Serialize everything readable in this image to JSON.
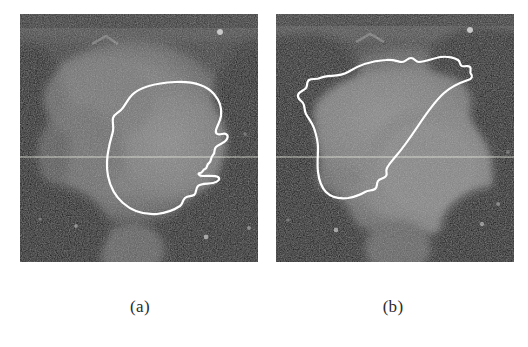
{
  "figure": {
    "type": "medical-image-figure",
    "modality": "cardiac CT cross-section",
    "background_color": "#ffffff",
    "panel_count": 2,
    "panels": [
      {
        "id": "a",
        "caption": "(a)",
        "x": 20,
        "y": 14,
        "width": 238,
        "height": 248,
        "contour_color": "#ffffff",
        "contour_label": "segmented-ventricle-contour",
        "description": "Left panel: grayscale cardiac cross-section with a white closed segmentation contour outlining a roughly circular chamber in the right-center region; the contour has a jagged indentation along its right border.",
        "scanline_y": 157,
        "scanline_color": "#e8e8e0"
      },
      {
        "id": "b",
        "caption": "(b)",
        "x": 276,
        "y": 14,
        "width": 238,
        "height": 248,
        "contour_color": "#ffffff",
        "contour_label": "segmented-ventricle-contour",
        "description": "Right panel: grayscale cardiac cross-section with a white closed segmentation contour outlining a crescent/wedge shaped chamber in the upper-left region.",
        "scanline_y": 157,
        "scanline_color": "#e8e8e0"
      }
    ]
  },
  "colors": {
    "page_background": "#ffffff",
    "contour_stroke": "#ffffff",
    "caption_text": "#2c2c2c",
    "image_dark": "#0d0d0d",
    "image_mid": "#6e6e6e",
    "image_bright": "#a8a8a8"
  }
}
